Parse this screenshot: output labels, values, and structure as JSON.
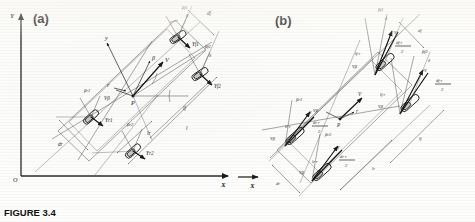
{
  "caption": "FIGURE 3.4",
  "panels": [
    {
      "id": "a",
      "label": "(a)",
      "global_axes": {
        "x": "X",
        "y": "Y",
        "origin": "O"
      },
      "body_axes": {
        "x": "x",
        "y": "y"
      },
      "center": {
        "point": "P",
        "velocity": "V",
        "yaw_rate": "r",
        "sideslip_angle": "β",
        "lateral_velocity": "Vβ"
      },
      "wheels": [
        {
          "name": "front-left",
          "slip_angle": "βf1",
          "steer_angle": "δ",
          "force": "Yf1"
        },
        {
          "name": "front-right",
          "slip_angle": "βf2",
          "steer_angle": "δ",
          "force": "Yf2"
        },
        {
          "name": "rear-left",
          "slip_angle": "βr1",
          "force": "Yr1"
        },
        {
          "name": "rear-right",
          "slip_angle": "βr2",
          "force": "Yr2"
        }
      ],
      "dimensions": [
        {
          "name": "front-track",
          "label": "df"
        },
        {
          "name": "rear-track",
          "label": "dr"
        },
        {
          "name": "front-axle-to-cg",
          "label": "lf"
        },
        {
          "name": "rear-axle-to-cg",
          "label": "lr"
        },
        {
          "name": "wheelbase",
          "label": "l"
        }
      ]
    },
    {
      "id": "b",
      "label": "(b)",
      "center": {
        "point": "P",
        "velocity": "V",
        "yaw_rate": "r",
        "lateral_velocity": "Vβ"
      },
      "wheels": [
        {
          "name": "front-left",
          "slip_angle": "βf1",
          "steer_angle": "δ",
          "velocity": "V",
          "lateral_velocity": "Vβ",
          "long_term": "lf r",
          "track_term_num": "df r",
          "track_term_den": "2"
        },
        {
          "name": "front-right",
          "slip_angle": "βf2",
          "steer_angle": "δ",
          "velocity": "V",
          "lateral_velocity": "Vβ",
          "long_term": "lf r",
          "track_term_num": "df r",
          "track_term_den": "2"
        },
        {
          "name": "rear-left",
          "slip_angle": "βr1",
          "velocity": "V",
          "lateral_velocity": "Vβ",
          "long_term": "lr r",
          "track_term_num": "dr r",
          "track_term_den": "2"
        },
        {
          "name": "rear-right",
          "slip_angle": "βr2",
          "velocity": "V",
          "lateral_velocity": "Vβ",
          "long_term": "lr r",
          "track_term_num": "dr r",
          "track_term_den": "2"
        }
      ],
      "dimensions": [
        {
          "name": "front-track",
          "label": "df"
        },
        {
          "name": "rear-track",
          "label": "dr"
        },
        {
          "name": "front-axle-to-cg",
          "label": "lf"
        },
        {
          "name": "rear-axle-to-cg",
          "label": "lr"
        }
      ],
      "global_axes": {
        "x": "X"
      }
    }
  ]
}
